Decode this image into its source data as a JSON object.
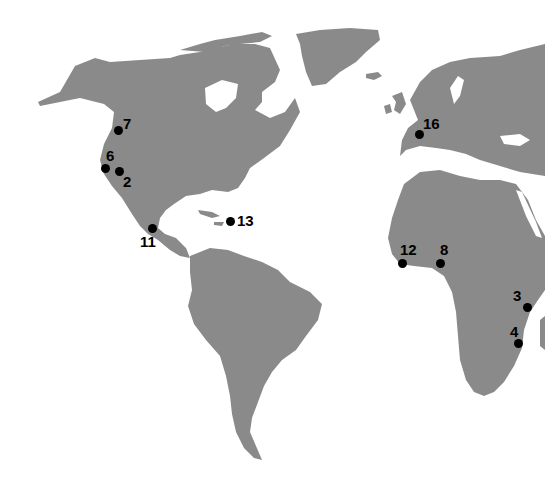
{
  "map": {
    "type": "world-map",
    "style": "grayscale halftone landmass",
    "colors": {
      "land": "#8a8a8a",
      "water": "#ffffff",
      "marker": "#000000"
    },
    "markers": [
      {
        "id": "7",
        "label": "7",
        "x": 118,
        "y": 130,
        "lx": 5,
        "ly": -14,
        "region": "Pacific Northwest, North America"
      },
      {
        "id": "6",
        "label": "6",
        "x": 105,
        "y": 168,
        "lx": 1,
        "ly": -20,
        "region": "California coast, North America"
      },
      {
        "id": "2",
        "label": "2",
        "x": 119,
        "y": 171,
        "lx": 4,
        "ly": 3,
        "region": "Southern California, North America"
      },
      {
        "id": "11",
        "label": "11",
        "x": 152,
        "y": 228,
        "lx": -12,
        "ly": 6,
        "region": "Central America"
      },
      {
        "id": "13",
        "label": "13",
        "x": 230,
        "y": 221,
        "lx": 7,
        "ly": -8,
        "region": "Caribbean"
      },
      {
        "id": "16",
        "label": "16",
        "x": 419,
        "y": 134,
        "lx": 4,
        "ly": -18,
        "region": "Northern Italy, Europe"
      },
      {
        "id": "12",
        "label": "12",
        "x": 402,
        "y": 263,
        "lx": -2,
        "ly": -21,
        "region": "West Africa coast"
      },
      {
        "id": "8",
        "label": "8",
        "x": 440,
        "y": 263,
        "lx": 0,
        "ly": -21,
        "region": "Gulf of Guinea, Africa"
      },
      {
        "id": "3",
        "label": "3",
        "x": 527,
        "y": 307,
        "lx": -14,
        "ly": -19,
        "region": "East Africa coast"
      },
      {
        "id": "4",
        "label": "4",
        "x": 518,
        "y": 343,
        "lx": -8,
        "ly": -19,
        "region": "Southeast Africa coast"
      }
    ]
  }
}
